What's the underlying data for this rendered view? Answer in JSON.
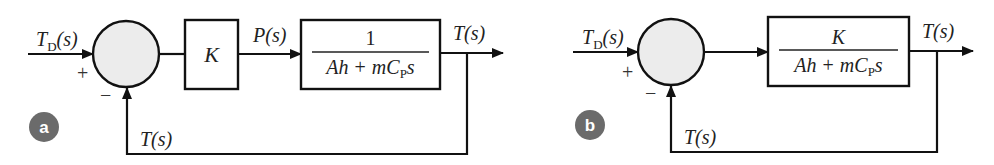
{
  "diagram": {
    "type": "block-diagram",
    "colors": {
      "line": "#111111",
      "junction_fill": "#ececec",
      "badge_fill": "#6b6b6b",
      "badge_text": "#ffffff",
      "text": "#222222"
    },
    "panels": [
      {
        "id": "a",
        "badge_label": "a",
        "input_label_main": "T",
        "input_label_sub": "D",
        "input_label_arg": "(s)",
        "plus_sign": "+",
        "minus_sign": "−",
        "gain_block_label": "K",
        "intermediate_signal": "P(s)",
        "plant_numerator": "1",
        "plant_denominator_a": "Ah",
        "plant_denominator_plus": "+",
        "plant_denominator_m": "mC",
        "plant_denominator_sub": "P",
        "plant_denominator_s": "s",
        "output_label": "T(s)",
        "feedback_label": "T(s)"
      },
      {
        "id": "b",
        "badge_label": "b",
        "input_label_main": "T",
        "input_label_sub": "D",
        "input_label_arg": "(s)",
        "plus_sign": "+",
        "minus_sign": "−",
        "plant_numerator": "K",
        "plant_denominator_a": "Ah",
        "plant_denominator_plus": "+",
        "plant_denominator_m": "mC",
        "plant_denominator_sub": "P",
        "plant_denominator_s": "s",
        "output_label": "T(s)",
        "feedback_label": "T(s)"
      }
    ]
  }
}
